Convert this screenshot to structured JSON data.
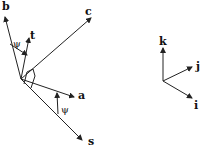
{
  "diagram": {
    "left_frame": {
      "origin": [
        21,
        79
      ],
      "vectors": [
        {
          "name": "b",
          "label": "b",
          "tip": [
            5,
            16
          ],
          "label_pos": [
            2,
            10
          ]
        },
        {
          "name": "t",
          "label": "t",
          "tip": [
            29,
            38
          ],
          "label_pos": [
            30,
            37
          ]
        },
        {
          "name": "c",
          "label": "c",
          "tip": [
            92,
            17
          ],
          "label_pos": [
            85,
            14
          ]
        },
        {
          "name": "a",
          "label": "a",
          "tip": [
            75,
            98
          ],
          "label_pos": [
            78,
            98
          ]
        },
        {
          "name": "s",
          "label": "s",
          "tip": [
            83,
            141
          ],
          "label_pos": [
            88,
            144
          ]
        }
      ],
      "angles": [
        {
          "label": "ψ",
          "between": [
            "b",
            "t"
          ],
          "label_pos": [
            13,
            47
          ]
        },
        {
          "label": "ψ",
          "between": [
            "a",
            "s"
          ],
          "label_pos": [
            61,
            113
          ]
        }
      ]
    },
    "right_frame": {
      "origin": [
        163,
        81
      ],
      "vectors": [
        {
          "name": "k",
          "label": "k",
          "tip": [
            163,
            47
          ],
          "label_pos": [
            159,
            45
          ]
        },
        {
          "name": "j",
          "label": "j",
          "tip": [
            193,
            67
          ],
          "label_pos": [
            196,
            69
          ]
        },
        {
          "name": "i",
          "label": "i",
          "tip": [
            193,
            99
          ],
          "label_pos": [
            194,
            109
          ]
        }
      ]
    }
  }
}
